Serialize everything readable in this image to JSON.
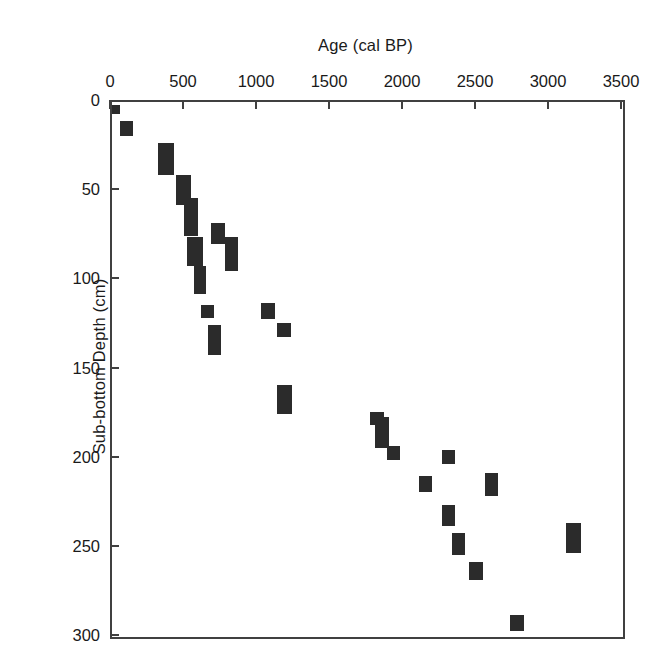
{
  "chart_data": {
    "type": "scatter",
    "title": "",
    "xlabel": "Age (cal BP)",
    "ylabel": "Sub-bottom Depth (cm)",
    "xlim": [
      0,
      3500
    ],
    "ylim": [
      0,
      300
    ],
    "y_inverted": true,
    "grid": false,
    "legend": null,
    "x_axis_position": "top",
    "xticks": [
      0,
      500,
      1000,
      1500,
      2000,
      2500,
      3000,
      3500
    ],
    "xtick_labels": [
      "0",
      "500",
      "1000",
      "1500",
      "2000",
      "2500",
      "3000",
      "3500"
    ],
    "yticks": [
      0,
      50,
      100,
      150,
      200,
      250,
      300
    ],
    "ytick_labels": [
      "0",
      "50",
      "100",
      "150",
      "200",
      "250",
      "300"
    ],
    "marker_color": "#2b2b2b",
    "axis_color": "#404040",
    "marker_shape": "rectangle",
    "note": "Each marker is a filled rectangle whose width spans the calibrated age uncertainty and whose height spans the sampled depth interval.",
    "points": [
      {
        "age": 40,
        "depth": 6,
        "age_lo": 15,
        "age_hi": 70,
        "depth_lo": 3,
        "depth_hi": 8
      },
      {
        "age": 110,
        "depth": 16,
        "age_lo": 70,
        "age_hi": 160,
        "depth_lo": 12,
        "depth_hi": 20
      },
      {
        "age": 380,
        "depth": 31,
        "age_lo": 330,
        "age_hi": 435,
        "depth_lo": 24,
        "depth_hi": 35
      },
      {
        "age": 380,
        "depth": 39,
        "age_lo": 330,
        "age_hi": 435,
        "depth_lo": 35,
        "depth_hi": 42
      },
      {
        "age": 500,
        "depth": 52,
        "age_lo": 455,
        "age_hi": 555,
        "depth_lo": 42,
        "depth_hi": 59
      },
      {
        "age": 560,
        "depth": 64,
        "age_lo": 510,
        "age_hi": 605,
        "depth_lo": 55,
        "depth_hi": 70
      },
      {
        "age": 555,
        "depth": 70,
        "age_lo": 505,
        "age_hi": 600,
        "depth_lo": 64,
        "depth_hi": 76
      },
      {
        "age": 580,
        "depth": 85,
        "age_lo": 530,
        "age_hi": 635,
        "depth_lo": 77,
        "depth_hi": 93
      },
      {
        "age": 720,
        "depth": 75,
        "age_lo": 690,
        "age_hi": 785,
        "depth_lo": 69,
        "depth_hi": 81
      },
      {
        "age": 805,
        "depth": 88,
        "age_lo": 785,
        "age_hi": 880,
        "depth_lo": 77,
        "depth_hi": 96
      },
      {
        "age": 640,
        "depth": 107,
        "age_lo": 575,
        "age_hi": 655,
        "depth_lo": 93,
        "depth_hi": 109
      },
      {
        "age": 680,
        "depth": 118,
        "age_lo": 620,
        "age_hi": 710,
        "depth_lo": 115,
        "depth_hi": 122
      },
      {
        "age": 725,
        "depth": 135,
        "age_lo": 670,
        "age_hi": 760,
        "depth_lo": 126,
        "depth_hi": 143
      },
      {
        "age": 1083,
        "depth": 118,
        "age_lo": 1035,
        "age_hi": 1130,
        "depth_lo": 114,
        "depth_hi": 123
      },
      {
        "age": 1193,
        "depth": 129,
        "age_lo": 1145,
        "age_hi": 1240,
        "depth_lo": 125,
        "depth_hi": 133
      },
      {
        "age": 1160,
        "depth": 168,
        "age_lo": 1145,
        "age_hi": 1250,
        "depth_lo": 160,
        "depth_hi": 176
      },
      {
        "age": 1805,
        "depth": 177,
        "age_lo": 1780,
        "age_hi": 1875,
        "depth_lo": 175,
        "depth_hi": 182
      },
      {
        "age": 1845,
        "depth": 183,
        "age_lo": 1815,
        "age_hi": 1910,
        "depth_lo": 178,
        "depth_hi": 195
      },
      {
        "age": 1930,
        "depth": 198,
        "age_lo": 1895,
        "age_hi": 1985,
        "depth_lo": 194,
        "depth_hi": 202
      },
      {
        "age": 2300,
        "depth": 201,
        "age_lo": 2275,
        "age_hi": 2365,
        "depth_lo": 196,
        "depth_hi": 204
      },
      {
        "age": 2130,
        "depth": 215,
        "age_lo": 2115,
        "age_hi": 2205,
        "depth_lo": 211,
        "depth_hi": 220
      },
      {
        "age": 2590,
        "depth": 214,
        "age_lo": 2570,
        "age_hi": 2660,
        "depth_lo": 209,
        "depth_hi": 222
      },
      {
        "age": 2300,
        "depth": 232,
        "age_lo": 2275,
        "age_hi": 2365,
        "depth_lo": 227,
        "depth_hi": 239
      },
      {
        "age": 2370,
        "depth": 248,
        "age_lo": 2340,
        "age_hi": 2435,
        "depth_lo": 243,
        "depth_hi": 255
      },
      {
        "age": 2480,
        "depth": 263,
        "age_lo": 2460,
        "age_hi": 2555,
        "depth_lo": 259,
        "depth_hi": 269
      },
      {
        "age": 3170,
        "depth": 246,
        "age_lo": 3125,
        "age_hi": 3225,
        "depth_lo": 237,
        "depth_hi": 254
      },
      {
        "age": 2760,
        "depth": 294,
        "age_lo": 2740,
        "age_hi": 2835,
        "depth_lo": 289,
        "depth_hi": 298
      }
    ]
  }
}
